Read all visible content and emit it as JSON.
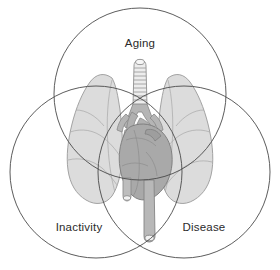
{
  "figure": {
    "type": "venn-diagram",
    "title": "",
    "background_color": "#ffffff",
    "circle_stroke_color": "#4a4a4a",
    "circle_stroke_width": 0.9,
    "circles": [
      {
        "id": "aging",
        "label": "Aging",
        "label_x": 140,
        "label_y": 44,
        "cx": 140,
        "cy": 94,
        "r": 86
      },
      {
        "id": "inactivity",
        "label": "Inactivity",
        "label_x": 79,
        "label_y": 228,
        "cx": 96,
        "cy": 172,
        "r": 86
      },
      {
        "id": "disease",
        "label": "Disease",
        "label_x": 204,
        "label_y": 228,
        "cx": 184,
        "cy": 172,
        "r": 86
      }
    ],
    "illustration": {
      "name": "thoracic-anatomy",
      "parts": [
        "left-lung",
        "right-lung",
        "trachea",
        "bronchi",
        "heart",
        "aortic-arch",
        "descending-aorta",
        "superior-vena-cava",
        "pulmonary-artery"
      ],
      "colors": {
        "lung_fill": "#dcdcdc",
        "lung_stroke": "#9a9a9a",
        "trachea_fill": "#e8e8e8",
        "trachea_stroke": "#8f8f8f",
        "vessel_fill": "#b5b5b5",
        "vessel_stroke": "#888888",
        "heart_fill": "#a9a9a9",
        "heart_stroke": "#7d7d7d"
      }
    }
  }
}
